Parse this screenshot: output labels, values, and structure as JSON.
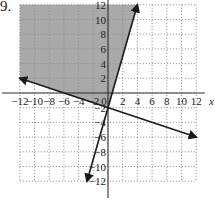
{
  "problem": {
    "number": "9."
  },
  "colors": {
    "shade": "#a9a9a9",
    "line": "#1a1a1a",
    "grid": "#8a8a8a",
    "axis": "#333333",
    "text": "#222222"
  },
  "chart_data": {
    "type": "line",
    "title": "",
    "xlabel": "x",
    "ylabel": "y",
    "xlim": [
      -12,
      12
    ],
    "ylim": [
      -12,
      12
    ],
    "grid": true,
    "x_ticks": [
      -12,
      -10,
      -8,
      -6,
      -4,
      -2,
      0,
      2,
      4,
      6,
      8,
      10,
      12
    ],
    "y_ticks": [
      -12,
      -10,
      -8,
      -6,
      -4,
      -2,
      2,
      4,
      6,
      8,
      10,
      12
    ],
    "x_tick_labels": [
      "−12",
      "−10",
      "−8",
      "−6",
      "−4",
      "−2",
      "0",
      "2",
      "4",
      "6",
      "8",
      "10",
      "12"
    ],
    "y_tick_labels": [
      "−12",
      "−10",
      "−8",
      "−6",
      "−4",
      "−2",
      "2",
      "4",
      "6",
      "8",
      "10",
      "12"
    ],
    "series": [
      {
        "name": "steep boundary line",
        "equation": "y = 3.5x − 2",
        "x": [
          -2.86,
          4
        ],
        "y": [
          -12,
          12
        ]
      },
      {
        "name": "shallow boundary line",
        "equation": "y = −x/3 − 2",
        "x": [
          -12,
          12
        ],
        "y": [
          2,
          -6
        ]
      }
    ],
    "shaded_region": {
      "description": "region above y = −x/3 − 2 and left of y = 3.5x − 2",
      "polygon": [
        [
          -12,
          2
        ],
        [
          -12,
          12
        ],
        [
          4,
          12
        ],
        [
          0,
          -2
        ]
      ]
    }
  }
}
